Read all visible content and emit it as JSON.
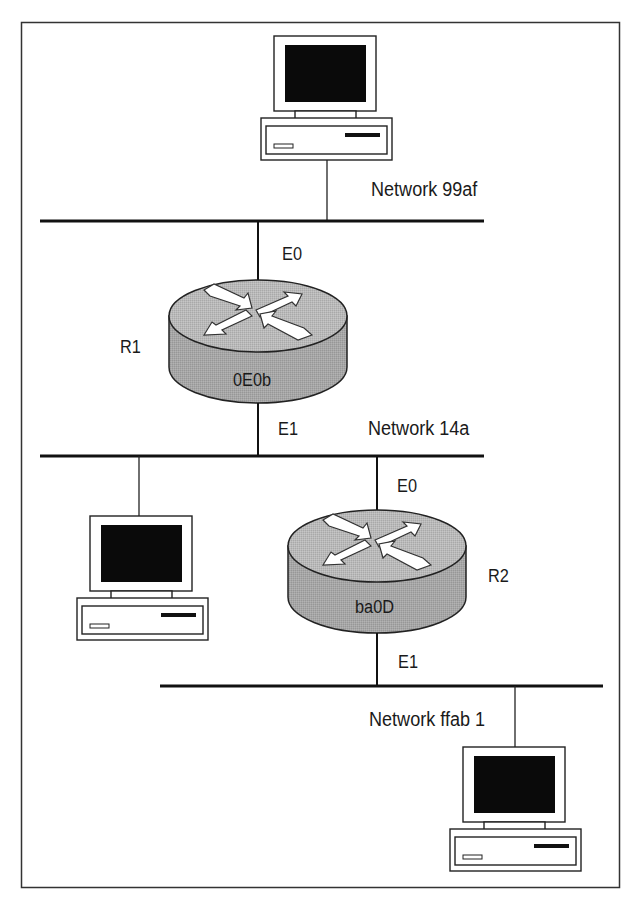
{
  "figure": {
    "border_color": "#333333",
    "router_top_color": "#b6b6b6",
    "router_side_color": "#a4a4a4"
  },
  "networks": [
    {
      "id": "net-99af",
      "label": "Network 99af"
    },
    {
      "id": "net-14a",
      "label": "Network 14a"
    },
    {
      "id": "net-ffab1",
      "label": "Network ffab 1"
    }
  ],
  "routers": [
    {
      "name": "R1",
      "address": "0E0b",
      "interfaces": [
        {
          "label": "E0",
          "network": "Network 99af"
        },
        {
          "label": "E1",
          "network": "Network 14a"
        }
      ]
    },
    {
      "name": "R2",
      "address": "ba0D",
      "interfaces": [
        {
          "label": "E0",
          "network": "Network 14a"
        },
        {
          "label": "E1",
          "network": "Network ffab 1"
        }
      ]
    }
  ],
  "hosts": [
    {
      "icon": "desktop-computer-icon",
      "network": "Network 99af"
    },
    {
      "icon": "desktop-computer-icon",
      "network": "Network 14a"
    },
    {
      "icon": "desktop-computer-icon",
      "network": "Network ffab 1"
    }
  ]
}
